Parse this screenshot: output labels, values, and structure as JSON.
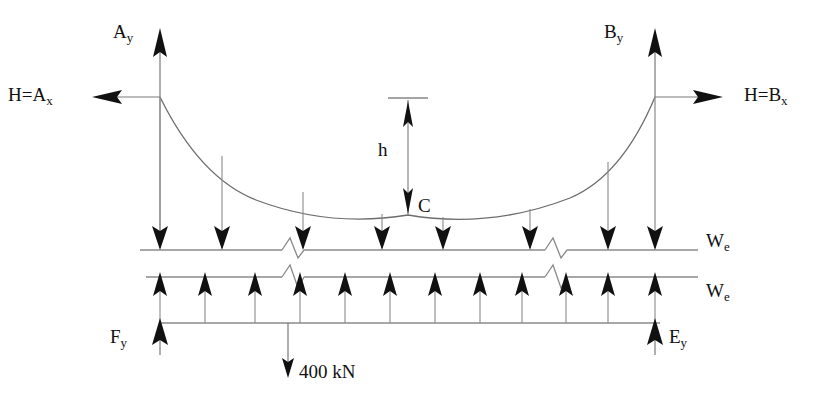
{
  "diagram": {
    "canvas": {
      "width": 824,
      "height": 403
    },
    "stroke_color": "#1a1a1a",
    "line_color": "#555555",
    "background": "#ffffff"
  },
  "labels": {
    "reaction_ay": "A",
    "reaction_ay_sub": "y",
    "reaction_by": "B",
    "reaction_by_sub": "y",
    "horizontal_left": "H=A",
    "horizontal_left_sub": "x",
    "horizontal_right": "H=B",
    "horizontal_right_sub": "x",
    "sag_height": "h",
    "low_point": "C",
    "load_upper": "W",
    "load_upper_sub": "e",
    "load_lower": "W",
    "load_lower_sub": "e",
    "reaction_fy": "F",
    "reaction_fy_sub": "y",
    "reaction_ey": "E",
    "reaction_ey_sub": "y",
    "point_load": "400 kN"
  },
  "geometry": {
    "left_tower_x": 160,
    "right_tower_x": 655,
    "tower_top_y": 97,
    "upper_beam_y": 250,
    "lower_beam_y": 277,
    "bottom_beam_y": 323,
    "cable_low_y": 215,
    "sag_dim_x": 408,
    "sag_top_y": 98,
    "point_load_x": 288,
    "point_load_tip_y": 375
  },
  "hangers": {
    "count": 8,
    "x_positions": [
      160,
      222,
      303,
      382,
      443,
      530,
      608,
      655
    ],
    "direction": "down"
  },
  "upward_loads": {
    "count": 11,
    "x_positions": [
      160,
      205,
      255,
      300,
      345,
      390,
      435,
      480,
      522,
      566,
      608,
      655
    ],
    "direction": "up"
  },
  "lower_verticals": {
    "x_positions": [
      160,
      205,
      255,
      300,
      345,
      390,
      435,
      480,
      522,
      566,
      608,
      655
    ]
  }
}
